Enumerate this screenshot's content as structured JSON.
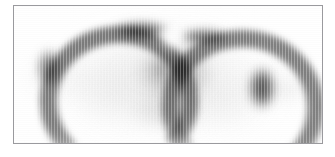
{
  "page": {
    "background_color": "#ffffff",
    "width": 335,
    "height": 157
  },
  "scan_panel": {
    "name": "tomographic-scan-image",
    "alt_text": "Grayscale tomographic scan slice showing two dark crescent-shaped uptake regions over a lighter elliptical body",
    "frame": {
      "border_color": "#9a9a9e",
      "border_width_px": 1,
      "left": 13,
      "top": 5,
      "width": 310,
      "height": 139
    },
    "canvas_background": "#ffffff",
    "modality_appearance": "grayscale-inverted-nuclear-medicine",
    "colors": {
      "darkest": "#4a4a4a",
      "mid_gray": "#9b9b9b",
      "light_gray": "#d2d2d2",
      "faint_gray": "#ededed",
      "background": "#ffffff"
    }
  },
  "chart_data": {
    "type": "heatmap",
    "title": "",
    "subtitle": "",
    "xlabel": "",
    "ylabel": "",
    "grid": false,
    "legend": "none",
    "colormap": "grayscale (dark = high intensity)",
    "xlim": [
      0,
      310
    ],
    "ylim": [
      0,
      139
    ],
    "annotations": [],
    "features": [
      {
        "id": "body-ellipse",
        "label": "central elliptical body outline",
        "kind": "ellipse",
        "cx": 150,
        "cy": 76,
        "rx": 118,
        "ry": 62,
        "intensity": 0.1,
        "color": "#e2e2e2",
        "blur": 10
      },
      {
        "id": "body-core",
        "label": "body core soft fill",
        "kind": "ellipse",
        "cx": 150,
        "cy": 72,
        "rx": 100,
        "ry": 52,
        "intensity": 0.14,
        "color": "#dcdcdc",
        "blur": 12
      },
      {
        "id": "left-wing",
        "label": "left lateral faint lobe",
        "kind": "ellipse",
        "cx": 42,
        "cy": 72,
        "rx": 40,
        "ry": 24,
        "intensity": 0.12,
        "color": "#e6e6e6",
        "blur": 9
      },
      {
        "id": "right-wing",
        "label": "right lateral faint lobe",
        "kind": "ellipse",
        "cx": 262,
        "cy": 80,
        "rx": 42,
        "ry": 25,
        "intensity": 0.12,
        "color": "#e6e6e6",
        "blur": 9
      },
      {
        "id": "right-wing-inner",
        "label": "right lateral lobe inner node",
        "kind": "ellipse",
        "cx": 272,
        "cy": 84,
        "rx": 20,
        "ry": 12,
        "intensity": 0.14,
        "color": "#dedede",
        "blur": 6
      },
      {
        "id": "left-crescent",
        "label": "left dark crescent uptake band",
        "kind": "arc",
        "cx": 88,
        "cy": 78,
        "rx": 62,
        "ry": 58,
        "thickness": 17,
        "start_deg": 200,
        "end_deg": 335,
        "intensity": 0.78,
        "color": "#555555",
        "blur": 3.4
      },
      {
        "id": "left-crescent-hotspot",
        "label": "left crescent peak intensity",
        "kind": "ellipse",
        "cx": 128,
        "cy": 24,
        "rx": 30,
        "ry": 9,
        "intensity": 0.52,
        "color": "#4f4f4f",
        "blur": 5
      },
      {
        "id": "left-crescent-tail",
        "label": "left crescent inferior tail",
        "kind": "ellipse",
        "cx": 35,
        "cy": 62,
        "rx": 12,
        "ry": 20,
        "intensity": 0.44,
        "color": "#5c5c5c",
        "blur": 5
      },
      {
        "id": "right-crescent",
        "label": "right dark crescent uptake band",
        "kind": "arc",
        "cx": 212,
        "cy": 84,
        "rx": 64,
        "ry": 60,
        "thickness": 17,
        "start_deg": 205,
        "end_deg": 345,
        "intensity": 0.76,
        "color": "#575757",
        "blur": 3.4
      },
      {
        "id": "right-crescent-hotspot",
        "label": "right crescent peak intensity",
        "kind": "ellipse",
        "cx": 190,
        "cy": 31,
        "rx": 26,
        "ry": 8,
        "intensity": 0.5,
        "color": "#525252",
        "blur": 5
      },
      {
        "id": "right-crescent-tail",
        "label": "right crescent inferior tail",
        "kind": "ellipse",
        "cx": 248,
        "cy": 82,
        "rx": 14,
        "ry": 22,
        "intensity": 0.5,
        "color": "#515151",
        "blur": 5
      },
      {
        "id": "central-mass",
        "label": "central mid-gray mass between crescents",
        "kind": "ellipse",
        "cx": 160,
        "cy": 68,
        "rx": 40,
        "ry": 28,
        "intensity": 0.3,
        "color": "#a6a6a6",
        "blur": 7
      },
      {
        "id": "central-mass-core",
        "label": "central mass denser core",
        "kind": "ellipse",
        "cx": 158,
        "cy": 62,
        "rx": 24,
        "ry": 16,
        "intensity": 0.26,
        "color": "#9e9e9e",
        "blur": 6
      },
      {
        "id": "inferior-mass",
        "label": "inferior mid-gray structure",
        "kind": "ellipse",
        "cx": 152,
        "cy": 104,
        "rx": 36,
        "ry": 20,
        "intensity": 0.2,
        "color": "#c2c2c2",
        "blur": 8
      },
      {
        "id": "left-midfield",
        "label": "left mid-field light haze",
        "kind": "ellipse",
        "cx": 92,
        "cy": 86,
        "rx": 46,
        "ry": 34,
        "intensity": 0.1,
        "color": "#e0e0e0",
        "blur": 10
      },
      {
        "id": "right-midfield",
        "label": "right mid-field light haze",
        "kind": "ellipse",
        "cx": 214,
        "cy": 96,
        "rx": 42,
        "ry": 30,
        "intensity": 0.11,
        "color": "#dedede",
        "blur": 10
      },
      {
        "id": "interhemispheric-gap",
        "label": "light gap separating the two crescents",
        "kind": "ellipse-light",
        "cx": 158,
        "cy": 30,
        "rx": 13,
        "ry": 16,
        "intensity": 0.95,
        "color": "#ffffff",
        "blur": 5
      },
      {
        "id": "superior-background",
        "label": "superior background clearing",
        "kind": "ellipse-light",
        "cx": 150,
        "cy": -4,
        "rx": 150,
        "ry": 18,
        "intensity": 0.85,
        "color": "#ffffff",
        "blur": 8
      },
      {
        "id": "inferior-background",
        "label": "inferior background clearing",
        "kind": "ellipse-light",
        "cx": 150,
        "cy": 150,
        "rx": 170,
        "ry": 24,
        "intensity": 0.85,
        "color": "#ffffff",
        "blur": 10
      }
    ]
  }
}
